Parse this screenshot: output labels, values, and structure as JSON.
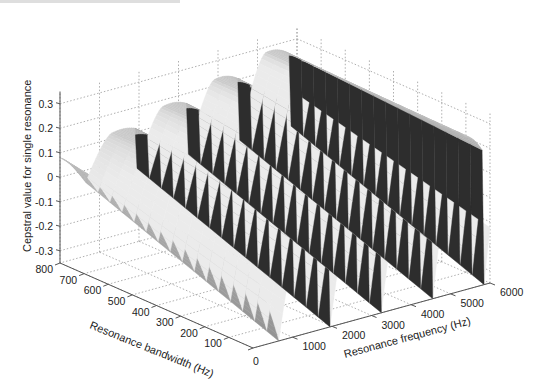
{
  "chart_data": {
    "type": "surface3d",
    "title": "",
    "xlabel": "Resonance frequency (Hz)",
    "ylabel": "Resonance bandwidth (Hz)",
    "zlabel": "Cepstral value for single resonance",
    "x_ticks": [
      "0",
      "1000",
      "2000",
      "3000",
      "4000",
      "5000",
      "6000"
    ],
    "y_ticks": [
      "0",
      "100",
      "200",
      "300",
      "400",
      "500",
      "600",
      "700",
      "800"
    ],
    "z_ticks": [
      "-0.3",
      "-0.2",
      "-0.1",
      "0",
      "0.1",
      "0.2",
      "0.3"
    ],
    "xlim": [
      0,
      6000
    ],
    "ylim": [
      0,
      800
    ],
    "zlim": [
      -0.35,
      0.35
    ],
    "grid": true,
    "colormap": "gray",
    "sample_ridges": [
      {
        "frequency_hz": 0,
        "bandwidth_hz": 800,
        "value": 0.08
      },
      {
        "frequency_hz": 1300,
        "bandwidth_hz": 800,
        "value": 0.17
      },
      {
        "frequency_hz": 2600,
        "bandwidth_hz": 800,
        "value": 0.23
      },
      {
        "frequency_hz": 3900,
        "bandwidth_hz": 800,
        "value": 0.27
      }
    ]
  },
  "axes": {
    "x_label": "Resonance frequency (Hz)",
    "y_label": "Resonance bandwidth (Hz)",
    "z_label": "Cepstral value for single resonance"
  }
}
